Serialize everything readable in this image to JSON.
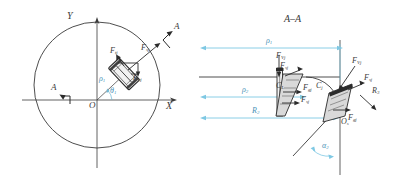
{
  "figure": {
    "title_section": "A–A",
    "colors": {
      "line": "#3a3a3a",
      "dimension": "#7ec8e3",
      "dimension_text": "#4a93b8",
      "background": "#ffffff"
    }
  },
  "left_view": {
    "name": "plan-view",
    "axis_y": "Y",
    "axis_x": "X",
    "origin": "O",
    "section_marker_left": "A",
    "section_marker_right": "A",
    "radius_label": "ρ",
    "radius_sub": "1",
    "angle_label": "θ",
    "angle_sub": "1",
    "forces": [
      {
        "name": "F-tangential-upper",
        "symbol": "F",
        "sub": "tj"
      },
      {
        "name": "F-resultant-upper",
        "symbol": "F",
        "sub": "sj"
      },
      {
        "name": "F-normal-lower",
        "symbol": "F",
        "sub": "nj"
      }
    ]
  },
  "right_view": {
    "name": "section-view",
    "title": "A–A",
    "origin": "O",
    "origin_sub": "s",
    "angle_label": "α",
    "angle_sub": "2",
    "dimensions": [
      {
        "name": "rho-1",
        "symbol": "ρ",
        "sub": "1"
      },
      {
        "name": "rho-2",
        "symbol": "ρ",
        "sub": "2"
      },
      {
        "name": "R-2",
        "symbol": "R",
        "sub": "2"
      }
    ],
    "centroid_left": {
      "symbol": "C",
      "sub": "L"
    },
    "centroid_right": {
      "symbol": "C",
      "sub": "j"
    },
    "forces_left": [
      {
        "name": "F-vertical-upper-left",
        "symbol": "F",
        "sub": "Vj"
      },
      {
        "name": "F-second-upper-left",
        "symbol": "F",
        "sub": "sj"
      },
      {
        "name": "F-horizontal-left",
        "symbol": "F",
        "sub": "gj"
      },
      {
        "name": "F-lower-left",
        "symbol": "F",
        "sub": "sj"
      }
    ],
    "forces_right": [
      {
        "name": "F-vertical-right",
        "symbol": "F",
        "sub": "Vj"
      },
      {
        "name": "F-upper-right",
        "symbol": "F",
        "sub": "sj"
      },
      {
        "name": "F-horizontal-right",
        "symbol": "F",
        "sub": "gj"
      }
    ],
    "reaction": {
      "name": "R-reaction",
      "symbol": "R",
      "sub": "3"
    }
  }
}
